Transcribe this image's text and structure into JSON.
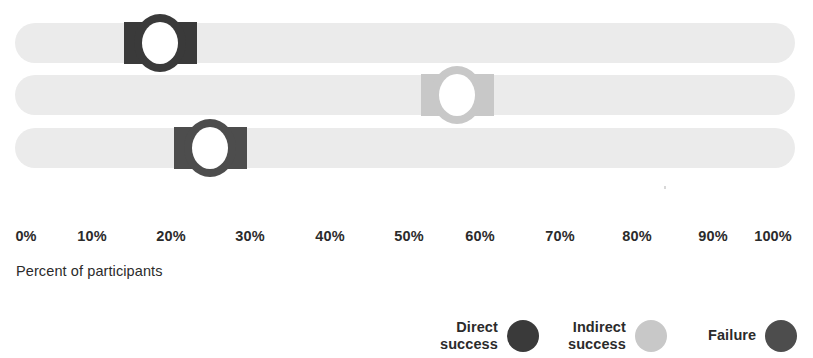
{
  "chart_data": {
    "type": "bar",
    "title": "",
    "subtitle": "",
    "xlabel": "Percent of participants",
    "ylabel": "",
    "xlim": [
      0,
      100
    ],
    "grid": false,
    "legend_position": "bottom-right",
    "orientation": "horizontal",
    "tick_labels": [
      "0%",
      "10%",
      "20%",
      "30%",
      "40%",
      "50%",
      "60%",
      "70%",
      "80%",
      "90%",
      "100%"
    ],
    "tick_values": [
      0,
      10,
      20,
      30,
      40,
      50,
      60,
      70,
      80,
      90,
      100
    ],
    "track_color": "#ebebeb",
    "categories": [
      "Task 1",
      "Task 2",
      "Task 3"
    ],
    "series": [
      {
        "name": "Direct success",
        "color": "#3a3a3a",
        "values": [
          18.6,
          null,
          null
        ]
      },
      {
        "name": "Indirect success",
        "color": "#c8c8c8",
        "values": [
          null,
          56.7,
          null
        ]
      },
      {
        "name": "Failure",
        "color": "#4d4d4d",
        "values": [
          null,
          null,
          25.0
        ]
      }
    ],
    "markers": [
      {
        "row": 0,
        "series": "Direct success",
        "value": 18.6,
        "color": "#3a3a3a",
        "top": 23
      },
      {
        "row": 1,
        "series": "Indirect success",
        "value": 56.7,
        "color": "#c8c8c8",
        "top": 75
      },
      {
        "row": 2,
        "series": "Failure",
        "value": 25.0,
        "color": "#4d4d4d",
        "top": 128
      }
    ],
    "legend": [
      {
        "label": "Direct\nsuccess",
        "color": "#3a3a3a",
        "left": 0
      },
      {
        "label": "Indirect\nsuccess",
        "color": "#c8c8c8",
        "left": 128
      },
      {
        "label": "Failure",
        "color": "#4d4d4d",
        "left": 268
      }
    ]
  },
  "axis": {
    "title": "Percent of participants",
    "ticks": [
      {
        "label": "0%",
        "x": 26
      },
      {
        "label": "10%",
        "x": 92
      },
      {
        "label": "20%",
        "x": 171
      },
      {
        "label": "30%",
        "x": 250
      },
      {
        "label": "40%",
        "x": 330
      },
      {
        "label": "50%",
        "x": 409
      },
      {
        "label": "60%",
        "x": 480
      },
      {
        "label": "70%",
        "x": 560
      },
      {
        "label": "80%",
        "x": 637
      },
      {
        "label": "90%",
        "x": 713
      },
      {
        "label": "100%",
        "x": 773
      }
    ]
  },
  "colors": {
    "direct_success": "#3a3a3a",
    "indirect_success": "#c8c8c8",
    "failure": "#4d4d4d",
    "track": "#ebebeb",
    "text": "#2b2b2b",
    "background": "#ffffff"
  }
}
